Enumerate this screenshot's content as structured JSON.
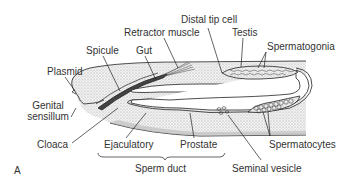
{
  "figure": {
    "panel_letter": "A",
    "labels": {
      "plasmid": "Plasmid",
      "spicule": "Spicule",
      "gut": "Gut",
      "retractor_muscle": "Retractor muscle",
      "distal_tip_cell": "Distal tip cell",
      "testis": "Testis",
      "spermatogonia": "Spermatogonia",
      "genital_sensillum_1": "Genital",
      "genital_sensillum_2": "sensillum",
      "cloaca": "Cloaca",
      "ejaculatory": "Ejaculatory",
      "prostate": "Prostate",
      "sperm_duct": "Sperm duct",
      "seminal_vesicle": "Seminal vesicle",
      "spermatocytes": "Spermatocytes"
    },
    "colors": {
      "line": "#222222",
      "stipple": "#d9d9d9",
      "text": "#333333",
      "background": "#ffffff"
    }
  }
}
